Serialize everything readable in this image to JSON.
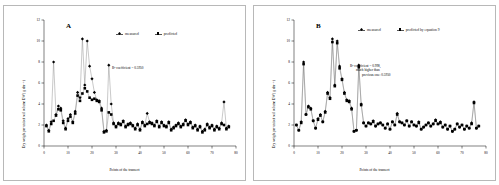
{
  "figure": {
    "panels": [
      {
        "id": "A",
        "letter": "A",
        "annotation": "R² coefficient = 0.5950",
        "annotation_lines": [
          "R² coefficient = 0.5950"
        ],
        "legend": [
          {
            "label": "measured",
            "marker": "diamond"
          },
          {
            "label": "predicted",
            "marker": "square"
          }
        ]
      },
      {
        "id": "B",
        "letter": "B",
        "annotation": "R² coefficient = 0.998, much higher than previous one: 0.5950",
        "annotation_lines": [
          "R² coefficient = 0.998,",
          "much higher than",
          "previous one: 0.5950"
        ],
        "legend": [
          {
            "label": "measured",
            "marker": "diamond"
          },
          {
            "label": "predicted by equation 9",
            "marker": "square"
          }
        ]
      }
    ]
  },
  "chart_data": [
    {
      "type": "line",
      "panel": "A",
      "title": "",
      "xlabel": "Points of the transect",
      "ylabel": "Dry weight per unit of soil volume DW ( g dm⁻³ )",
      "xlim": [
        0,
        80
      ],
      "ylim": [
        0,
        12
      ],
      "xticks": [
        0,
        10,
        20,
        30,
        40,
        50,
        60,
        70,
        80
      ],
      "yticks": [
        0,
        2,
        4,
        6,
        8,
        10,
        12
      ],
      "grid": false,
      "legend_position": "top-center",
      "annotation": "R² coefficient = 0.5950",
      "x": [
        1,
        2,
        3,
        4,
        5,
        6,
        7,
        8,
        9,
        10,
        11,
        12,
        13,
        14,
        15,
        16,
        17,
        18,
        19,
        20,
        21,
        22,
        23,
        24,
        25,
        26,
        27,
        28,
        29,
        30,
        31,
        32,
        33,
        34,
        35,
        36,
        37,
        38,
        39,
        40,
        41,
        42,
        43,
        44,
        45,
        46,
        47,
        48,
        49,
        50,
        51,
        52,
        53,
        54,
        55,
        56,
        57,
        58,
        59,
        60,
        61,
        62,
        63,
        64,
        65,
        66,
        67,
        68,
        69,
        70,
        71,
        72,
        73,
        74,
        75,
        76,
        77
      ],
      "series": [
        {
          "name": "measured",
          "marker": "diamond",
          "values": [
            2.0,
            1.5,
            2.3,
            8.0,
            3.0,
            3.8,
            3.6,
            2.4,
            1.7,
            2.6,
            3.0,
            2.3,
            3.3,
            5.1,
            4.6,
            10.2,
            5.8,
            10.0,
            7.6,
            6.4,
            5.1,
            4.4,
            4.3,
            3.6,
            1.4,
            1.5,
            7.7,
            4.0,
            2.2,
            1.9,
            2.2,
            2.1,
            2.4,
            1.9,
            2.1,
            2.2,
            2.0,
            1.7,
            2.1,
            1.6,
            2.3,
            2.0,
            3.1,
            2.3,
            2.2,
            2.0,
            2.4,
            1.9,
            2.3,
            2.0,
            1.9,
            2.3,
            1.6,
            1.8,
            2.0,
            2.2,
            1.9,
            2.1,
            2.5,
            2.1,
            2.3,
            1.8,
            2.0,
            1.6,
            1.9,
            1.4,
            1.6,
            2.1,
            1.8,
            2.0,
            1.6,
            1.9,
            1.7,
            2.2,
            4.2,
            1.7,
            1.9
          ]
        },
        {
          "name": "predicted",
          "marker": "square",
          "values": [
            1.9,
            1.4,
            2.1,
            2.4,
            2.9,
            3.5,
            3.4,
            2.2,
            1.6,
            2.4,
            2.8,
            2.2,
            3.1,
            4.8,
            4.3,
            5.0,
            5.5,
            5.2,
            4.6,
            4.4,
            4.5,
            4.3,
            4.2,
            3.4,
            1.3,
            1.4,
            3.2,
            3.0,
            2.1,
            1.8,
            2.1,
            2.0,
            2.3,
            1.8,
            2.0,
            2.1,
            1.9,
            1.6,
            2.0,
            1.5,
            2.2,
            1.9,
            2.1,
            2.2,
            2.1,
            1.9,
            2.3,
            1.8,
            2.2,
            1.9,
            1.8,
            2.2,
            1.5,
            1.7,
            1.9,
            2.1,
            1.8,
            2.0,
            2.4,
            2.0,
            2.2,
            1.7,
            1.9,
            1.5,
            1.8,
            1.3,
            1.5,
            2.0,
            1.7,
            1.9,
            1.5,
            1.8,
            1.6,
            2.1,
            2.0,
            1.6,
            1.8
          ]
        }
      ]
    },
    {
      "type": "line",
      "panel": "B",
      "title": "",
      "xlabel": "Points of the transect",
      "ylabel": "Dry weight per unit of soil volume DW ( g dm⁻³ )",
      "xlim": [
        0,
        80
      ],
      "ylim": [
        0,
        12
      ],
      "xticks": [
        0,
        10,
        20,
        30,
        40,
        50,
        60,
        70,
        80
      ],
      "yticks": [
        0,
        2,
        4,
        6,
        8,
        10,
        12
      ],
      "grid": false,
      "legend_position": "top-center",
      "annotation": "R² coefficient = 0.998, much higher than previous one: 0.5950",
      "x": [
        1,
        2,
        3,
        4,
        5,
        6,
        7,
        8,
        9,
        10,
        11,
        12,
        13,
        14,
        15,
        16,
        17,
        18,
        19,
        20,
        21,
        22,
        23,
        24,
        25,
        26,
        27,
        28,
        29,
        30,
        31,
        32,
        33,
        34,
        35,
        36,
        37,
        38,
        39,
        40,
        41,
        42,
        43,
        44,
        45,
        46,
        47,
        48,
        49,
        50,
        51,
        52,
        53,
        54,
        55,
        56,
        57,
        58,
        59,
        60,
        61,
        62,
        63,
        64,
        65,
        66,
        67,
        68,
        69,
        70,
        71,
        72,
        73,
        74,
        75,
        76,
        77
      ],
      "series": [
        {
          "name": "measured",
          "marker": "diamond",
          "values": [
            2.0,
            1.5,
            2.3,
            8.0,
            3.0,
            3.8,
            3.6,
            2.4,
            1.7,
            2.6,
            3.0,
            2.3,
            3.3,
            5.1,
            4.6,
            10.2,
            5.8,
            10.0,
            7.6,
            6.4,
            5.1,
            4.4,
            4.3,
            3.6,
            1.4,
            1.5,
            7.7,
            4.0,
            2.2,
            1.9,
            2.2,
            2.1,
            2.4,
            1.9,
            2.1,
            2.2,
            2.0,
            1.7,
            2.1,
            1.6,
            2.3,
            2.0,
            3.1,
            2.3,
            2.2,
            2.0,
            2.4,
            1.9,
            2.3,
            2.0,
            1.9,
            2.3,
            1.6,
            1.8,
            2.0,
            2.2,
            1.9,
            2.1,
            2.5,
            2.1,
            2.3,
            1.8,
            2.0,
            1.6,
            1.9,
            1.4,
            1.6,
            2.1,
            1.8,
            2.0,
            1.6,
            1.9,
            1.7,
            2.2,
            4.2,
            1.7,
            1.9
          ]
        },
        {
          "name": "predicted by equation 9",
          "marker": "square",
          "values": [
            2.0,
            1.5,
            2.2,
            7.8,
            3.0,
            3.7,
            3.5,
            2.4,
            1.7,
            2.5,
            2.9,
            2.3,
            3.2,
            5.0,
            4.5,
            9.9,
            5.7,
            9.8,
            7.4,
            6.3,
            5.0,
            4.3,
            4.2,
            3.5,
            1.4,
            1.5,
            7.5,
            3.9,
            2.2,
            1.9,
            2.2,
            2.1,
            2.3,
            1.9,
            2.1,
            2.2,
            2.0,
            1.7,
            2.1,
            1.6,
            2.3,
            2.0,
            3.0,
            2.3,
            2.2,
            2.0,
            2.4,
            1.9,
            2.3,
            2.0,
            1.9,
            2.2,
            1.6,
            1.8,
            2.0,
            2.2,
            1.9,
            2.1,
            2.4,
            2.1,
            2.2,
            1.8,
            2.0,
            1.6,
            1.9,
            1.4,
            1.6,
            2.1,
            1.8,
            2.0,
            1.6,
            1.9,
            1.7,
            2.1,
            4.1,
            1.7,
            1.9
          ]
        }
      ]
    }
  ]
}
